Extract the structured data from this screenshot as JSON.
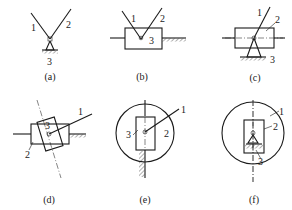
{
  "figure": {
    "panels": [
      {
        "id": "a",
        "caption": "(a)",
        "labels": {
          "l1": "1",
          "l2": "2",
          "l3": "3"
        }
      },
      {
        "id": "b",
        "caption": "(b)",
        "labels": {
          "l1": "1",
          "l2": "2",
          "l3": "3"
        }
      },
      {
        "id": "c",
        "caption": "(c)",
        "labels": {
          "l1": "1",
          "l2": "2",
          "l3": "3"
        }
      },
      {
        "id": "d",
        "caption": "(d)",
        "labels": {
          "l1": "1",
          "l2": "2",
          "l3": "3"
        }
      },
      {
        "id": "e",
        "caption": "(e)",
        "labels": {
          "l1": "1",
          "l2": "2",
          "l3": "3"
        }
      },
      {
        "id": "f",
        "caption": "(f)",
        "labels": {
          "l1": "1",
          "l2": "2",
          "l3": "3"
        }
      }
    ]
  }
}
